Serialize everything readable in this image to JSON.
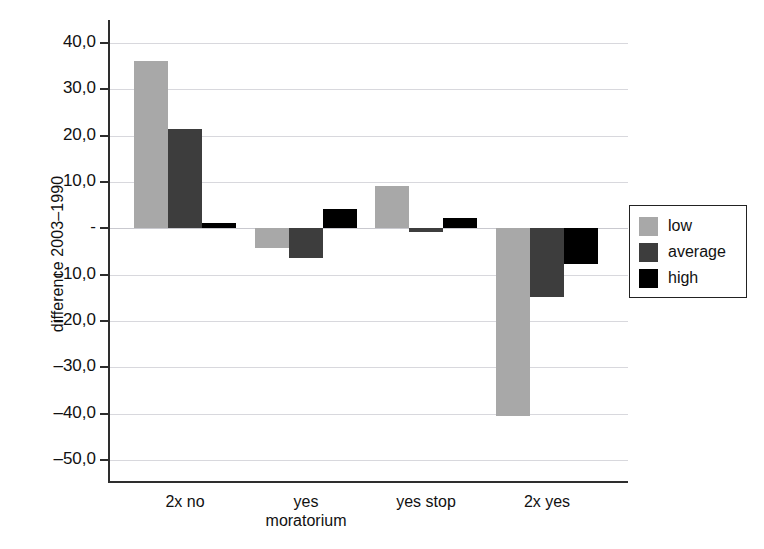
{
  "chart_data": {
    "type": "bar",
    "title": "",
    "subtitle": "",
    "xlabel": "",
    "ylabel": "difference 2003–1990",
    "categories": [
      "2x no",
      "yes\nmoratorium",
      "yes stop",
      "2x yes"
    ],
    "category_labels": [
      {
        "line1": "2x no",
        "line2": ""
      },
      {
        "line1": "yes",
        "line2": "moratorium"
      },
      {
        "line1": "yes stop",
        "line2": ""
      },
      {
        "line1": "2x yes",
        "line2": ""
      }
    ],
    "series": [
      {
        "name": "low",
        "color": "#a8a8a8",
        "values": [
          36.1,
          -4.3,
          9.2,
          -40.5
        ]
      },
      {
        "name": "average",
        "color": "#3d3d3d",
        "values": [
          21.4,
          -6.5,
          -0.7,
          -14.8
        ]
      },
      {
        "name": "high",
        "color": "#000000",
        "values": [
          1.1,
          4.1,
          2.2,
          -7.8
        ]
      }
    ],
    "ylim": [
      -55,
      45
    ],
    "yticks": [
      40,
      30,
      20,
      10,
      0,
      -10,
      -20,
      -30,
      -40,
      -50
    ],
    "ytick_labels": [
      "40,0",
      "30,0",
      "20,0",
      "10,0",
      "-",
      "–10,0",
      "–20,0",
      "–30,0",
      "–40,0",
      "–50,0"
    ],
    "grid": true,
    "legend_position": "right",
    "legend_entries": [
      {
        "label": "low",
        "color": "#a8a8a8"
      },
      {
        "label": "average",
        "color": "#3d3d3d"
      },
      {
        "label": "high",
        "color": "#000000"
      }
    ]
  }
}
